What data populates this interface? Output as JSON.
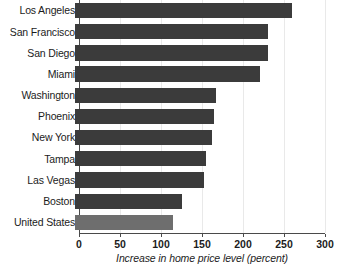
{
  "chart_data": {
    "type": "bar",
    "orientation": "horizontal",
    "title": "",
    "xlabel": "Increase in home price level (percent)",
    "ylabel": "",
    "xlim": [
      0,
      300
    ],
    "xticks": [
      0,
      50,
      100,
      150,
      200,
      250,
      300
    ],
    "grid": true,
    "legend": "none",
    "categories": [
      "Los Angeles",
      "San Francisco",
      "San Diego",
      "Miami",
      "Washington",
      "Phoenix",
      "New York",
      "Tampa",
      "Las Vegas",
      "Boston",
      "United States"
    ],
    "values": [
      265,
      235,
      235,
      225,
      172,
      170,
      167,
      160,
      157,
      130,
      120
    ],
    "highlight_category": "United States",
    "colors": {
      "bar": "#3b3b3b",
      "bar_highlight": "#6e6e6e",
      "axis": "#4a4a4a",
      "grid": "#e9e9e9",
      "text": "#1c1c1c",
      "background": "#ffffff"
    }
  }
}
